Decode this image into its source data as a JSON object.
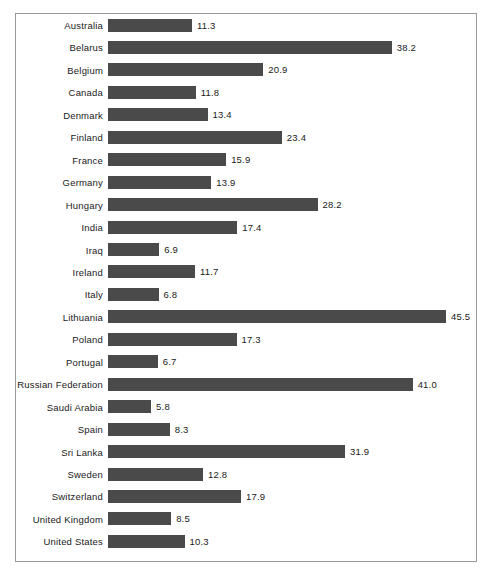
{
  "chart_data": {
    "type": "bar",
    "orientation": "horizontal",
    "title": "",
    "subtitle": "",
    "xlabel": "",
    "ylabel": "",
    "grid": false,
    "legend": null,
    "xlim": [
      0,
      47.5
    ],
    "value_labels_shown": true,
    "bar_color": "#4a4a4a",
    "frame_color": "#9a9a9a",
    "background_color": "#ffffff",
    "categories": [
      "Australia",
      "Belarus",
      "Belgium",
      "Canada",
      "Denmark",
      "Finland",
      "France",
      "Germany",
      "Hungary",
      "India",
      "Iraq",
      "Ireland",
      "Italy",
      "Lithuania",
      "Poland",
      "Portugal",
      "Russian Federation",
      "Saudi Arabia",
      "Spain",
      "Sri Lanka",
      "Sweden",
      "Switzerland",
      "United Kingdom",
      "United States"
    ],
    "values": [
      11.3,
      38.2,
      20.9,
      11.8,
      13.4,
      23.4,
      15.9,
      13.9,
      28.2,
      17.4,
      6.9,
      11.7,
      6.8,
      45.5,
      17.3,
      6.7,
      41.0,
      5.8,
      8.3,
      31.9,
      12.8,
      17.9,
      8.5,
      10.3
    ],
    "value_text": [
      "11.3",
      "38.2",
      "20.9",
      "11.8",
      "13.4",
      "23.4",
      "15.9",
      "13.9",
      "28.2",
      "17.4",
      "6.9",
      "11.7",
      "6.8",
      "45.5",
      "17.3",
      "6.7",
      "41.0",
      "5.8",
      "8.3",
      "31.9",
      "12.8",
      "17.9",
      "8.5",
      "10.3"
    ]
  }
}
